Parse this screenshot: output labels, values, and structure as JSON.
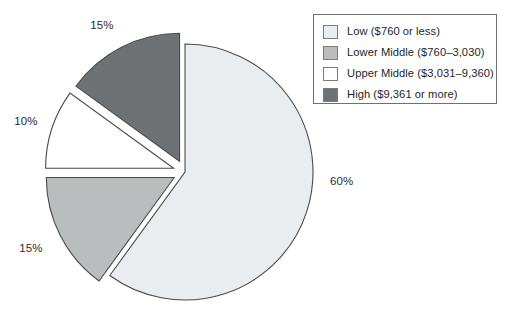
{
  "chart_data": {
    "type": "pie",
    "title": "",
    "labels": [
      "Low ($760 or less)",
      "Lower Middle ($760–3,030)",
      "Upper Middle ($3,031–9,360)",
      "High ($9,361 or more)"
    ],
    "values": [
      60,
      15,
      10,
      15
    ],
    "value_labels": [
      "60%",
      "15%",
      "10%",
      "15%"
    ],
    "colors": [
      "#e9edef",
      "#b9bdbe",
      "#ffffff",
      "#6e7274"
    ],
    "exploded": [
      false,
      true,
      true,
      true
    ],
    "legend_position": "top-right",
    "grid": false,
    "slices": [
      {
        "label": "Low ($760 or less)",
        "value": 60,
        "value_label": "60%",
        "color": "#e9edef",
        "exploded": false
      },
      {
        "label": "Lower Middle ($760–3,030)",
        "value": 15,
        "value_label": "15%",
        "color": "#b9bdbe",
        "exploded": true
      },
      {
        "label": "Upper Middle ($3,031–9,360)",
        "value": 10,
        "value_label": "10%",
        "color": "#ffffff",
        "exploded": true
      },
      {
        "label": "High ($9,361 or more)",
        "value": 15,
        "value_label": "15%",
        "color": "#6e7274",
        "exploded": true
      }
    ]
  },
  "labels": {
    "low": "60%",
    "lower_middle": "15%",
    "upper_middle": "10%",
    "high": "15%"
  },
  "legend": {
    "items": [
      {
        "label": "Low ($760 or less)",
        "color": "#e9edef"
      },
      {
        "label": "Lower Middle ($760–3,030)",
        "color": "#b9bdbe"
      },
      {
        "label": "Upper Middle ($3,031–9,360)",
        "color": "#ffffff"
      },
      {
        "label": "High ($9,361 or more)",
        "color": "#6e7274"
      }
    ]
  }
}
